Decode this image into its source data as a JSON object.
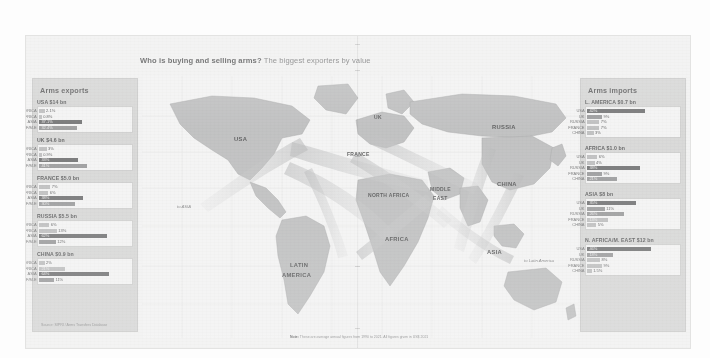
{
  "headline": {
    "bold": "Who is buying and selling arms?",
    "rest": " The biggest exporters by value"
  },
  "note": {
    "prefix": "Note:",
    "text": " These are average annual figures from 1990 to 2021. All figures given in US$ 2021"
  },
  "exports": {
    "title": "Arms exports",
    "source": "Source: SIPRI / Arms Transfers Database",
    "blocks": [
      {
        "name": "USA",
        "head": "USA $14 bn",
        "rows": [
          {
            "label": "L. AMERICA",
            "value": "2.1%",
            "pct": 6,
            "shade": "light"
          },
          {
            "label": "AFRICA",
            "value": "0.8%",
            "pct": 3,
            "shade": "light"
          },
          {
            "label": "ASIA",
            "value": "37.1%",
            "pct": 46,
            "shade": "dark"
          },
          {
            "label": "N.AF/M.E",
            "value": "32.4%",
            "pct": 40,
            "shade": "mid"
          }
        ]
      },
      {
        "name": "UK",
        "head": "UK $4.6 bn",
        "rows": [
          {
            "label": "L. AMERICA",
            "value": "3%",
            "pct": 8,
            "shade": "light"
          },
          {
            "label": "AFRICA",
            "value": "0.9%",
            "pct": 3,
            "shade": "light"
          },
          {
            "label": "ASIA",
            "value": "33%",
            "pct": 41,
            "shade": "dark"
          },
          {
            "label": "N.AF/M.E",
            "value": "41%",
            "pct": 51,
            "shade": "mid"
          }
        ]
      },
      {
        "name": "FRANCE",
        "head": "FRANCE $5.0 bn",
        "rows": [
          {
            "label": "L. AMERICA",
            "value": "7%",
            "pct": 12,
            "shade": "light"
          },
          {
            "label": "AFRICA",
            "value": "6%",
            "pct": 10,
            "shade": "light"
          },
          {
            "label": "ASIA",
            "value": "38%",
            "pct": 47,
            "shade": "dark"
          },
          {
            "label": "N.AF/M.E",
            "value": "30%",
            "pct": 38,
            "shade": "mid"
          }
        ]
      },
      {
        "name": "RUSSIA",
        "head": "RUSSIA $5.5 bn",
        "rows": [
          {
            "label": "L. AMERICA",
            "value": "6%",
            "pct": 11,
            "shade": "light"
          },
          {
            "label": "AFRICA",
            "value": "13%",
            "pct": 19,
            "shade": "light"
          },
          {
            "label": "ASIA",
            "value": "62%",
            "pct": 72,
            "shade": "dark"
          },
          {
            "label": "N.AF/M.E",
            "value": "12%",
            "pct": 18,
            "shade": "mid"
          }
        ]
      },
      {
        "name": "CHINA",
        "head": "CHINA $0.9 bn",
        "rows": [
          {
            "label": "L. AMERICA",
            "value": "2%",
            "pct": 6,
            "shade": "light"
          },
          {
            "label": "AFRICA",
            "value": "21%",
            "pct": 28,
            "shade": "light"
          },
          {
            "label": "ASIA",
            "value": "64%",
            "pct": 74,
            "shade": "dark"
          },
          {
            "label": "N.AF/M.E",
            "value": "11%",
            "pct": 16,
            "shade": "mid"
          }
        ]
      }
    ]
  },
  "imports": {
    "title": "Arms imports",
    "blocks": [
      {
        "name": "L. AMERICA",
        "head": "L. AMERICA $0.7 bn",
        "rows": [
          {
            "label": "USA",
            "value": "42%",
            "pct": 62,
            "shade": "dark"
          },
          {
            "label": "UK",
            "value": "9%",
            "pct": 16,
            "shade": "mid"
          },
          {
            "label": "RUSSIA",
            "value": "7%",
            "pct": 13,
            "shade": "light"
          },
          {
            "label": "FRANCE",
            "value": "7%",
            "pct": 13,
            "shade": "light"
          },
          {
            "label": "CHINA",
            "value": "3%",
            "pct": 7,
            "shade": "light"
          }
        ]
      },
      {
        "name": "AFRICA",
        "head": "AFRICA $1.0 bn",
        "rows": [
          {
            "label": "USA",
            "value": "6%",
            "pct": 11,
            "shade": "light"
          },
          {
            "label": "UK",
            "value": "4%",
            "pct": 8,
            "shade": "light"
          },
          {
            "label": "RUSSIA",
            "value": "38%",
            "pct": 56,
            "shade": "dark"
          },
          {
            "label": "FRANCE",
            "value": "9%",
            "pct": 16,
            "shade": "mid"
          },
          {
            "label": "CHINA",
            "value": "21%",
            "pct": 32,
            "shade": "mid"
          }
        ]
      },
      {
        "name": "ASIA",
        "head": "ASIA $8 bn",
        "rows": [
          {
            "label": "USA",
            "value": "35%",
            "pct": 52,
            "shade": "dark"
          },
          {
            "label": "UK",
            "value": "11%",
            "pct": 19,
            "shade": "mid"
          },
          {
            "label": "RUSSIA",
            "value": "26%",
            "pct": 39,
            "shade": "mid"
          },
          {
            "label": "FRANCE",
            "value": "13%",
            "pct": 22,
            "shade": "light"
          },
          {
            "label": "CHINA",
            "value": "5%",
            "pct": 10,
            "shade": "light"
          }
        ]
      },
      {
        "name": "N. AFRICA/M. EAST",
        "head": "N. AFRICA/M. EAST $12 bn",
        "rows": [
          {
            "label": "USA",
            "value": "46%",
            "pct": 68,
            "shade": "dark"
          },
          {
            "label": "UK",
            "value": "18%",
            "pct": 28,
            "shade": "mid"
          },
          {
            "label": "RUSSIA",
            "value": "8%",
            "pct": 14,
            "shade": "light"
          },
          {
            "label": "FRANCE",
            "value": "9%",
            "pct": 16,
            "shade": "light"
          },
          {
            "label": "CHINA",
            "value": "1.5%",
            "pct": 5,
            "shade": "light"
          }
        ]
      }
    ]
  },
  "map": {
    "labels": [
      {
        "key": "usa",
        "text": "USA",
        "x": 92,
        "y": 60,
        "size": "md"
      },
      {
        "key": "uk",
        "text": "UK",
        "x": 232,
        "y": 38,
        "size": "sm"
      },
      {
        "key": "france",
        "text": "FRANCE",
        "x": 205,
        "y": 75,
        "size": "sm"
      },
      {
        "key": "russia",
        "text": "RUSSIA",
        "x": 350,
        "y": 48,
        "size": "md"
      },
      {
        "key": "china",
        "text": "CHINA",
        "x": 355,
        "y": 105,
        "size": "md"
      },
      {
        "key": "north-africa",
        "text": "NORTH AFRICA",
        "x": 226,
        "y": 116,
        "size": "sm"
      },
      {
        "key": "middle-east",
        "text": "MIDDLE",
        "x": 288,
        "y": 110,
        "size": "sm"
      },
      {
        "key": "middle-east2",
        "text": "EAST",
        "x": 291,
        "y": 119,
        "size": "sm"
      },
      {
        "key": "africa",
        "text": "AFRICA",
        "x": 243,
        "y": 160,
        "size": "md"
      },
      {
        "key": "asia",
        "text": "ASIA",
        "x": 345,
        "y": 173,
        "size": "md"
      },
      {
        "key": "latin",
        "text": "LATIN",
        "x": 148,
        "y": 186,
        "size": "md"
      },
      {
        "key": "latin2",
        "text": "AMERICA",
        "x": 140,
        "y": 196,
        "size": "md"
      }
    ],
    "flows": [
      {
        "key": "to-asia",
        "text": "to ASIA",
        "x": 35,
        "y": 128
      },
      {
        "key": "to-latin-america",
        "text": "to Latin America",
        "x": 382,
        "y": 182
      }
    ]
  }
}
